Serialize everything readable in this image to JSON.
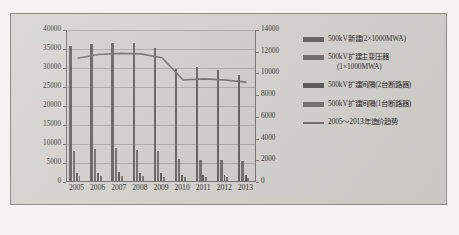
{
  "figure": {
    "background_color": "#d3d2cd",
    "plot_background_color": "#cfcec9"
  },
  "chart_data": {
    "type": "bar",
    "title": "",
    "subtitle": "",
    "xlabel": "",
    "ylabel": "",
    "y2label": "",
    "categories": [
      "2005",
      "2006",
      "2007",
      "2008",
      "2009",
      "2010",
      "2011",
      "2012",
      "2013"
    ],
    "ylim": [
      0,
      40000
    ],
    "y2lim": [
      0,
      14000
    ],
    "yticks": [
      "0",
      "5000",
      "10000",
      "15000",
      "20000",
      "25000",
      "30000",
      "35000",
      "40000"
    ],
    "y2ticks": [
      "0",
      "2000",
      "4000",
      "6000",
      "8000",
      "10000",
      "12000",
      "14000"
    ],
    "grid": true,
    "legend_position": "right",
    "series": [
      {
        "name": "500kV新建(2×1000MWA)",
        "kind": "bar",
        "axis": "left",
        "color": "#5d5c59",
        "values": [
          35400,
          36000,
          36300,
          36200,
          35000,
          29400,
          30000,
          29200,
          28000
        ]
      },
      {
        "name": "500kV扩建主变压器(1×1000MWA)",
        "kind": "bar",
        "axis": "left",
        "color": "#6a6966",
        "values": [
          8000,
          8500,
          8600,
          8200,
          7800,
          5800,
          5500,
          5400,
          5200
        ]
      },
      {
        "name": "500kV扩建间隔(2台断路器)",
        "kind": "bar",
        "axis": "left",
        "color": "#575653",
        "values": [
          2100,
          2200,
          2300,
          2150,
          2000,
          1700,
          1650,
          1600,
          1550
        ]
      },
      {
        "name": "500kV扩建间隔(1台断路器)",
        "kind": "bar",
        "axis": "left",
        "color": "#6f6e6b",
        "values": [
          1200,
          1250,
          1300,
          1220,
          1150,
          980,
          950,
          930,
          900
        ]
      },
      {
        "name": "2005～2013年造价趋势",
        "kind": "line",
        "axis": "right",
        "color": "#6d6c69",
        "values": [
          11400,
          11750,
          11850,
          11800,
          11450,
          9400,
          9500,
          9400,
          9200
        ]
      }
    ]
  },
  "legend": {
    "items": [
      {
        "label": "500kV新建(2×1000MWA)",
        "label_line2": "",
        "swatch": "#5d5c59",
        "marker": "bar"
      },
      {
        "label": "500kV扩建主变压器",
        "label_line2": "(1×1000MWA)",
        "swatch": "#6a6966",
        "marker": "bar"
      },
      {
        "label": "500kV扩建间隔(2台断路器)",
        "label_line2": "",
        "swatch": "#575653",
        "marker": "bar"
      },
      {
        "label": "500kV扩建间隔(1台断路器)",
        "label_line2": "",
        "swatch": "#6f6e6b",
        "marker": "bar"
      },
      {
        "label": "2005～2013年造价趋势",
        "label_line2": "",
        "swatch": "#6d6c69",
        "marker": "line"
      }
    ]
  }
}
